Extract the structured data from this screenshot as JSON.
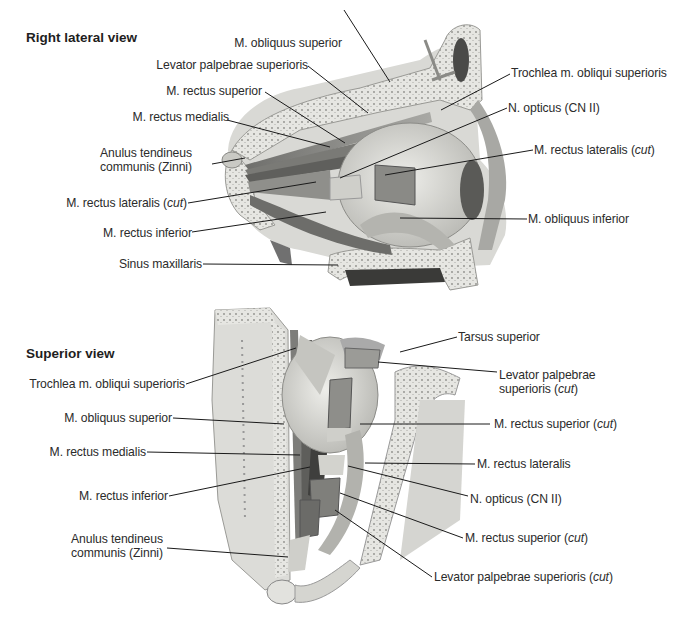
{
  "panels": [
    {
      "id": "lateral",
      "title": "Right lateral view",
      "labels": [
        {
          "text": "M. obliquus superior",
          "cut": false
        },
        {
          "text": "Levator palpebrae superioris",
          "cut": false
        },
        {
          "text": "M. rectus superior",
          "cut": false
        },
        {
          "text": "M. rectus medialis",
          "cut": false
        },
        {
          "text": "Anulus tendineus",
          "text2": "communis (Zinni)",
          "cut": false
        },
        {
          "text": "M. rectus lateralis (",
          "cut": true
        },
        {
          "text": "M. rectus inferior",
          "cut": false
        },
        {
          "text": "Sinus maxillaris",
          "cut": false
        },
        {
          "text": "Trochlea m. obliqui superioris",
          "cut": false
        },
        {
          "text": "N. opticus (CN II)",
          "cut": false
        },
        {
          "text": "M. rectus lateralis (",
          "cut": true
        },
        {
          "text": "M. obliquus inferior",
          "cut": false
        }
      ]
    },
    {
      "id": "superior",
      "title": "Superior view",
      "labels": [
        {
          "text": "Trochlea m. obliqui superioris",
          "cut": false
        },
        {
          "text": "M. obliquus superior",
          "cut": false
        },
        {
          "text": "M. rectus medialis",
          "cut": false
        },
        {
          "text": "M. rectus inferior",
          "cut": false
        },
        {
          "text": "Anulus tendineus",
          "text2": "communis (Zinni)",
          "cut": false
        },
        {
          "text": "Tarsus superior",
          "cut": false
        },
        {
          "text": "Levator palpebrae",
          "text2": "superioris (",
          "cut": true
        },
        {
          "text": "M. rectus superior (",
          "cut": true
        },
        {
          "text": "M. rectus lateralis",
          "cut": false
        },
        {
          "text": "N. opticus (CN II)",
          "cut": false
        },
        {
          "text": "M. rectus superior (",
          "cut": true
        },
        {
          "text": "Levator palpebrae superioris (",
          "cut": true
        }
      ]
    }
  ],
  "cut_word": "cut",
  "cut_close": ")",
  "colors": {
    "label_text": "#2b2b2b",
    "leader_line": "#1a1a1a",
    "bone": "#e4e4e0",
    "muscle": "#8a8a86",
    "globe": "#d6d6d2"
  }
}
